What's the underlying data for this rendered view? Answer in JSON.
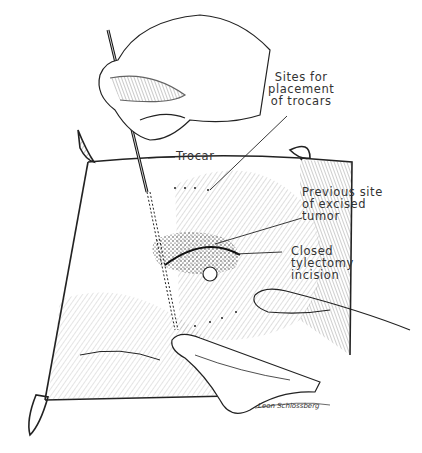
{
  "figure": {
    "labels": {
      "trocar_sites": "Sites for\nplacement\nof trocars",
      "trocar": "Trocar",
      "tumor_site": "Previous site\nof excised\ntumor",
      "incision": "Closed\ntylectomy\nincision"
    },
    "signature": "Leon Schlossberg",
    "colors": {
      "ink": "#222222",
      "paper": "#ffffff",
      "label": "#333333"
    }
  }
}
